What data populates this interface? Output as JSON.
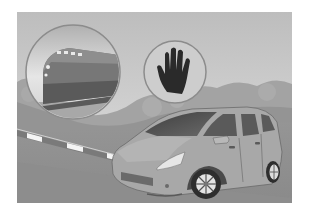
{
  "illustration": {
    "title": "Vehicle stopped at railroad crossing barrier",
    "elements": [
      {
        "name": "train-inset",
        "icon": "train-icon",
        "desc": "Approaching locomotive in circular inset"
      },
      {
        "name": "stop-hand-sign",
        "icon": "stop-hand-icon",
        "desc": "Black raised hand in circle"
      },
      {
        "name": "crossing-barrier",
        "desc": "Striped crossing gate arm, lowered"
      },
      {
        "name": "minivan",
        "desc": "Minivan stopped before the barrier"
      }
    ]
  },
  "colors": {
    "background_page": "#ffffff",
    "sky": "#cfcfcf",
    "sky_top": "#bdbdbd",
    "bushes": "#9a9a9a",
    "road": "#8a8a8a",
    "road_light": "#9c9c9c",
    "circle_fill": "#c9c9c9",
    "circle_stroke": "#8c8c8c",
    "hand": "#2a2a2a",
    "train_body": "#6f6f6f",
    "train_dark": "#3e3e3e",
    "car_body": "#a6a6a6",
    "car_shade": "#8f8f8f",
    "car_glass": "#505050",
    "barrier_white": "#f4f4f4",
    "barrier_gray": "#7a7a7a"
  }
}
